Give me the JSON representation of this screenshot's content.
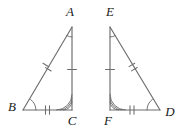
{
  "figure": {
    "background_color": "#ffffff",
    "stroke_color": "#6d6d6d",
    "label_color": "#1a1a1a",
    "triangles": [
      {
        "name": "triangle-abc",
        "vertices": [
          {
            "id": "A",
            "label": "A",
            "x": 72,
            "y": 27,
            "label_x": 70,
            "label_y": 13
          },
          {
            "id": "B",
            "label": "B",
            "x": 23,
            "y": 110,
            "label_x": 12,
            "label_y": 108
          },
          {
            "id": "C",
            "label": "C",
            "x": 72,
            "y": 110,
            "label_x": 72,
            "label_y": 122
          }
        ],
        "sides": [
          {
            "name": "side-AB",
            "from": "A",
            "to": "B",
            "ticks": 2
          },
          {
            "name": "side-BC",
            "from": "B",
            "to": "C",
            "ticks": 2
          },
          {
            "name": "side-AC",
            "from": "A",
            "to": "C",
            "ticks": 1
          }
        ],
        "angles": [
          {
            "name": "angle-A",
            "at": "A",
            "arcs": 1
          },
          {
            "name": "angle-B",
            "at": "B",
            "arcs": 1
          },
          {
            "name": "angle-C",
            "at": "C",
            "arcs": 3
          }
        ]
      },
      {
        "name": "triangle-efd",
        "vertices": [
          {
            "id": "E",
            "label": "E",
            "x": 110,
            "y": 27,
            "label_x": 110,
            "label_y": 13
          },
          {
            "id": "F",
            "label": "F",
            "x": 110,
            "y": 110,
            "label_x": 108,
            "label_y": 122
          },
          {
            "id": "D",
            "label": "D",
            "x": 160,
            "y": 110,
            "label_x": 170,
            "label_y": 113
          }
        ],
        "sides": [
          {
            "name": "side-ED",
            "from": "E",
            "to": "D",
            "ticks": 2
          },
          {
            "name": "side-FD",
            "from": "F",
            "to": "D",
            "ticks": 2
          },
          {
            "name": "side-EF",
            "from": "E",
            "to": "F",
            "ticks": 1
          }
        ],
        "angles": [
          {
            "name": "angle-E",
            "at": "E",
            "arcs": 1
          },
          {
            "name": "angle-F",
            "at": "F",
            "arcs": 3
          },
          {
            "name": "angle-D",
            "at": "D",
            "arcs": 1
          }
        ]
      }
    ],
    "labels": {
      "A": "A",
      "B": "B",
      "C": "C",
      "D": "D",
      "E": "E",
      "F": "F"
    }
  }
}
